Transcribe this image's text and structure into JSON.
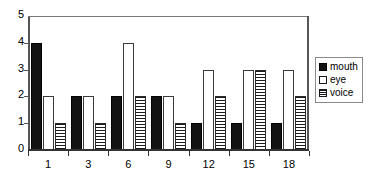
{
  "chart_data": {
    "type": "bar",
    "title": "",
    "subtitle": "",
    "xlabel": "",
    "ylabel": "",
    "categories": [
      "1",
      "3",
      "6",
      "9",
      "12",
      "15",
      "18"
    ],
    "series": [
      {
        "name": "mouth",
        "values": [
          4,
          2,
          2,
          2,
          1,
          1,
          1
        ],
        "fill": "solid-black",
        "color": "#121212"
      },
      {
        "name": "eye",
        "values": [
          2,
          2,
          4,
          2,
          3,
          3,
          3
        ],
        "fill": "white-outline",
        "color": "#ffffff"
      },
      {
        "name": "voice",
        "values": [
          1,
          1,
          2,
          1,
          2,
          3,
          2
        ],
        "fill": "horizontal-hatch",
        "color": "#1b1b1b"
      }
    ],
    "ylim": [
      0,
      5
    ],
    "y_ticks": [
      "0",
      "1",
      "2",
      "3",
      "4",
      "5"
    ],
    "x_ticks": [
      "1",
      "3",
      "6",
      "9",
      "12",
      "15",
      "18"
    ],
    "grid": false,
    "legend_position": "right-outside",
    "legend_entries": [
      "mouth",
      "eye",
      "voice"
    ]
  },
  "legend": {
    "items": [
      {
        "label": "mouth"
      },
      {
        "label": "eye"
      },
      {
        "label": "voice"
      }
    ]
  }
}
